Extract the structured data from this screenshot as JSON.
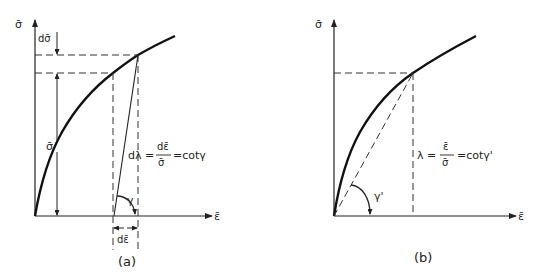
{
  "figure": {
    "panel_a": {
      "caption": "(a)",
      "y_axis_label": "σ̄",
      "x_axis_label": "ε̄",
      "d_sigma_label": "dσ̄",
      "sigma_label": "σ̄",
      "d_epsilon_label": "dε̄",
      "gamma_label": "γ",
      "formula": {
        "lhs": "dλ =",
        "numerator": "dε̄",
        "denominator": "σ̄",
        "rhs": "=cotγ"
      }
    },
    "panel_b": {
      "caption": "(b)",
      "y_axis_label": "σ̄",
      "x_axis_label": "ε̄",
      "gamma_label": "γ'",
      "formula": {
        "lhs": "λ =",
        "numerator": "ε̄",
        "denominator": "σ̄",
        "rhs": "=cotγ'"
      }
    },
    "colors": {
      "ink": "#222222",
      "background": "#ffffff"
    }
  }
}
